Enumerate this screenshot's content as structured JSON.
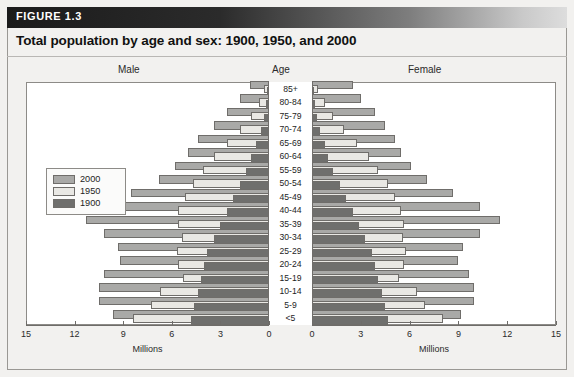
{
  "figure": {
    "label": "FIGURE 1.3",
    "title": "Total population by age and sex: 1900, 1950, and 2000"
  },
  "captions": {
    "male": "Male",
    "age": "Age",
    "female": "Female"
  },
  "legend": {
    "items": [
      {
        "label": "2000",
        "color": "#a9a9a7"
      },
      {
        "label": "1950",
        "color": "#e9e8e4"
      },
      {
        "label": "1900",
        "color": "#6f6f6d"
      }
    ]
  },
  "axis": {
    "title": "Millions",
    "ticks": [
      0,
      3,
      6,
      9,
      12,
      15
    ],
    "male_tick_labels": [
      "15",
      "12",
      "9",
      "6",
      "3",
      "0"
    ],
    "female_tick_labels": [
      "0",
      "3",
      "6",
      "9",
      "12",
      "15"
    ],
    "max": 15,
    "min": 0
  },
  "chart_data": {
    "type": "bar",
    "title": "Total population by age and sex: 1900, 1950, and 2000",
    "subtype": "population-pyramid",
    "xlabel": "Millions",
    "ylabel": "Age",
    "xlim": [
      0,
      15
    ],
    "grid": false,
    "legend_position": "top-left",
    "categories": [
      "85+",
      "80-84",
      "75-79",
      "70-74",
      "65-69",
      "60-64",
      "55-59",
      "50-54",
      "45-49",
      "40-44",
      "35-39",
      "30-34",
      "25-29",
      "20-24",
      "15-19",
      "10-14",
      "5-9",
      "<5"
    ],
    "series": [
      {
        "name": "2000",
        "sex": "Male",
        "values": [
          1.2,
          1.8,
          2.6,
          3.4,
          4.4,
          5.0,
          5.8,
          6.8,
          8.5,
          10.2,
          11.3,
          10.2,
          9.3,
          9.2,
          10.2,
          10.5,
          10.5,
          9.6
        ]
      },
      {
        "name": "1950",
        "sex": "Male",
        "values": [
          0.3,
          0.6,
          1.1,
          1.8,
          2.6,
          3.4,
          4.1,
          4.7,
          5.2,
          5.6,
          5.6,
          5.4,
          5.7,
          5.6,
          5.3,
          6.7,
          7.3,
          8.4
        ]
      },
      {
        "name": "1900",
        "sex": "Male",
        "values": [
          0.1,
          0.2,
          0.3,
          0.5,
          0.8,
          1.1,
          1.4,
          1.8,
          2.2,
          2.6,
          3.0,
          3.4,
          3.8,
          4.0,
          4.2,
          4.4,
          4.6,
          4.8
        ]
      },
      {
        "name": "2000",
        "sex": "Female",
        "values": [
          2.5,
          3.0,
          3.9,
          4.5,
          5.1,
          5.5,
          6.1,
          7.1,
          8.7,
          10.4,
          11.6,
          10.4,
          9.3,
          9.0,
          9.7,
          10.0,
          10.0,
          9.2
        ]
      },
      {
        "name": "1950",
        "sex": "Female",
        "values": [
          0.4,
          0.8,
          1.3,
          2.0,
          2.8,
          3.5,
          4.1,
          4.7,
          5.1,
          5.5,
          5.7,
          5.6,
          5.8,
          5.7,
          5.4,
          6.5,
          7.0,
          8.1
        ]
      },
      {
        "name": "1900",
        "sex": "Female",
        "values": [
          0.1,
          0.2,
          0.3,
          0.5,
          0.8,
          1.0,
          1.3,
          1.7,
          2.1,
          2.5,
          2.9,
          3.3,
          3.7,
          3.9,
          4.1,
          4.3,
          4.5,
          4.7
        ]
      }
    ]
  }
}
